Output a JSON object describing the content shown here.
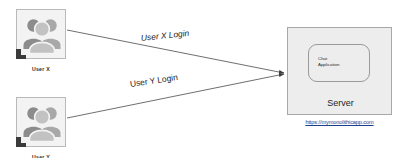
{
  "diagram": {
    "background_color": "#ffffff"
  },
  "users": [
    {
      "id": "user-x",
      "label": "User X",
      "icon": "people-group-icon",
      "x": 16,
      "y": 9,
      "box_fill": "#f3f3f3",
      "box_stroke": "#b9b9b9"
    },
    {
      "id": "user-y",
      "label": "User Y",
      "icon": "people-group-icon",
      "x": 16,
      "y": 97,
      "box_fill": "#f3f3f3",
      "box_stroke": "#b9b9b9"
    }
  ],
  "edges": [
    {
      "id": "edge-user-x-login",
      "label": "User X Login",
      "from": "user-x",
      "to": "server",
      "arrow": "arrow-head-icon",
      "stroke": "#4a4a4a"
    },
    {
      "id": "edge-user-y-login",
      "label": "User Y  Login",
      "from": "user-y",
      "to": "server",
      "arrow": "arrow-head-icon",
      "stroke": "#4a4a4a"
    }
  ],
  "server": {
    "label": "Server",
    "fill": "#ededed",
    "stroke": "#a8a8a8",
    "inner": {
      "label_line_1": "Chat",
      "label_line_2": "Application",
      "stroke": "#9a9a9a"
    },
    "url": "https://mymonolithicapp.com",
    "url_color": "#1b3f8f"
  }
}
